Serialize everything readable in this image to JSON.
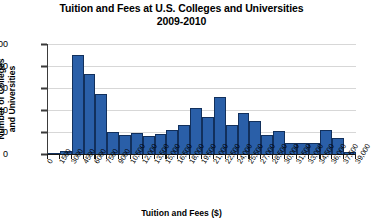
{
  "chart_data": {
    "type": "bar",
    "title": "Tuition and Fees at U.S. Colleges and Universities",
    "subtitle": "2009-2010",
    "xlabel": "Tuition and Fees ($)",
    "ylabel_line1": "Number of Colleges",
    "ylabel_line2": "and Universities",
    "ylim": [
      0,
      100
    ],
    "ytick_values": [
      0,
      20,
      40,
      60,
      80,
      100
    ],
    "ytick_labels": [
      "0",
      "20",
      "40",
      "60",
      "80",
      "100"
    ],
    "xlim": [
      0,
      39000
    ],
    "bin_width": 1500,
    "xtick_values": [
      0,
      1500,
      3000,
      4500,
      6000,
      7500,
      9000,
      10500,
      12000,
      13500,
      15000,
      16500,
      18000,
      19500,
      21000,
      22500,
      24000,
      25500,
      27000,
      28500,
      30000,
      31500,
      33000,
      34500,
      36000,
      37500,
      39000
    ],
    "xtick_labels": [
      "0",
      "1500",
      "3000",
      "4500",
      "6000",
      "7500",
      "9000",
      "10,500",
      "12,000",
      "13,500",
      "15,000",
      "16,500",
      "18,000",
      "19,500",
      "21,000",
      "22,500",
      "24,000",
      "25,500",
      "27,000",
      "28,500",
      "30,000",
      "31,500",
      "33,000",
      "34,500",
      "36,000",
      "37,500",
      "39,000"
    ],
    "grid": true,
    "grid_axis": "y",
    "legend": "none",
    "bar_color": "#2a5fa8",
    "bar_edge_color": "#12305c",
    "bins": [
      {
        "range": "0-1500",
        "start": 0,
        "end": 1500,
        "value": 1
      },
      {
        "range": "1500-3000",
        "start": 1500,
        "end": 3000,
        "value": 3
      },
      {
        "range": "3000-4500",
        "start": 3000,
        "end": 4500,
        "value": 90
      },
      {
        "range": "4500-6000",
        "start": 4500,
        "end": 6000,
        "value": 73
      },
      {
        "range": "6000-7500",
        "start": 6000,
        "end": 7500,
        "value": 55
      },
      {
        "range": "7500-9000",
        "start": 7500,
        "end": 9000,
        "value": 20
      },
      {
        "range": "9000-10,500",
        "start": 9000,
        "end": 10500,
        "value": 17
      },
      {
        "range": "10,500-12,000",
        "start": 10500,
        "end": 12000,
        "value": 19
      },
      {
        "range": "12,000-13,500",
        "start": 12000,
        "end": 13500,
        "value": 16
      },
      {
        "range": "13,500-15,000",
        "start": 13500,
        "end": 15000,
        "value": 18
      },
      {
        "range": "15,000-16,500",
        "start": 15000,
        "end": 16500,
        "value": 22
      },
      {
        "range": "16,500-18,000",
        "start": 16500,
        "end": 18000,
        "value": 26
      },
      {
        "range": "18,000-19,500",
        "start": 18000,
        "end": 19500,
        "value": 42
      },
      {
        "range": "19,500-21,000",
        "start": 19500,
        "end": 21000,
        "value": 34
      },
      {
        "range": "21,000-22,500",
        "start": 21000,
        "end": 22500,
        "value": 52
      },
      {
        "range": "22,500-24,000",
        "start": 22500,
        "end": 24000,
        "value": 26
      },
      {
        "range": "24,000-25,500",
        "start": 24000,
        "end": 25500,
        "value": 37
      },
      {
        "range": "25,500-27,000",
        "start": 25500,
        "end": 27000,
        "value": 30
      },
      {
        "range": "27,000-28,500",
        "start": 27000,
        "end": 28500,
        "value": 17
      },
      {
        "range": "28,500-30,000",
        "start": 28500,
        "end": 30000,
        "value": 21
      },
      {
        "range": "30,000-31,500",
        "start": 30000,
        "end": 31500,
        "value": 10
      },
      {
        "range": "31,500-33,000",
        "start": 31500,
        "end": 33000,
        "value": 10
      },
      {
        "range": "33,000-34,500",
        "start": 33000,
        "end": 34500,
        "value": 10
      },
      {
        "range": "34,500-36,000",
        "start": 34500,
        "end": 36000,
        "value": 22
      },
      {
        "range": "36,000-37,500",
        "start": 36000,
        "end": 37500,
        "value": 15
      },
      {
        "range": "37,500-39,000",
        "start": 37500,
        "end": 39000,
        "value": 2
      }
    ]
  }
}
